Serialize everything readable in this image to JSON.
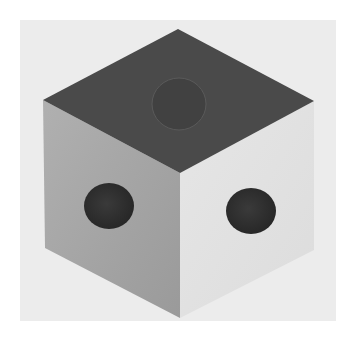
{
  "image": {
    "subject": "die-cube",
    "description": "Isometric view of a cube showing three faces, each with one circular pip",
    "colors": {
      "background": "#ffffff",
      "panel": "#ececec",
      "top_face": "#4a4a4a",
      "left_face": "#a6a6a6",
      "right_face": "#e2e2e2",
      "top_pip": "#404040",
      "side_pips": "#2e2e2e"
    },
    "faces": [
      {
        "name": "top",
        "pips": 1
      },
      {
        "name": "left",
        "pips": 1
      },
      {
        "name": "right",
        "pips": 1
      }
    ]
  }
}
